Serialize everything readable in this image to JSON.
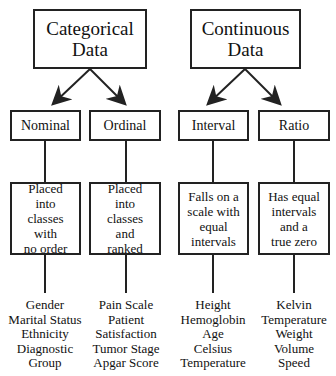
{
  "diagram": {
    "categorical": {
      "title_line1": "Categorical",
      "title_line2": "Data",
      "children": [
        {
          "label": "Nominal",
          "description": [
            "Placed",
            "into",
            "classes",
            "with",
            "no order"
          ],
          "examples": [
            "Gender",
            "Marital Status",
            "Ethnicity",
            "Diagnostic",
            "Group"
          ]
        },
        {
          "label": "Ordinal",
          "description": [
            "Placed",
            "into",
            "classes",
            "and",
            "ranked"
          ],
          "examples": [
            "Pain Scale",
            "Patient",
            "Satisfaction",
            "Tumor Stage",
            "Apgar Score"
          ]
        }
      ]
    },
    "continuous": {
      "title_line1": "Continuous",
      "title_line2": "Data",
      "children": [
        {
          "label": "Interval",
          "description": [
            "Falls on a",
            "scale with",
            "equal",
            "intervals"
          ],
          "examples": [
            "Height",
            "Hemoglobin",
            "Age",
            "Celsius",
            "Temperature"
          ]
        },
        {
          "label": "Ratio",
          "description": [
            "Has equal",
            "intervals",
            "and a",
            "true zero"
          ],
          "examples": [
            "Kelvin",
            "Temperature",
            "Weight",
            "Volume",
            "Speed"
          ]
        }
      ]
    }
  }
}
